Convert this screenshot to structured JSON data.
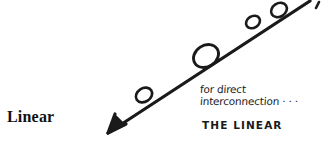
{
  "figure": {
    "background_color": "#ffffff",
    "ink_color": "#1a1a1a",
    "label": "Linear",
    "arrow": {
      "name": "diagonal-arrow",
      "direction": "down-left",
      "start": [
        310,
        1
      ],
      "end": [
        108,
        133
      ]
    },
    "nodes": [
      {
        "name": "node-1",
        "cx": 279,
        "cy": 10,
        "r": 8
      },
      {
        "name": "node-2",
        "cx": 253,
        "cy": 22,
        "r": 7
      },
      {
        "name": "node-3",
        "cx": 206,
        "cy": 56,
        "r": 12.5
      },
      {
        "name": "node-4",
        "cx": 144,
        "cy": 95,
        "r": 8
      }
    ],
    "tick_mark": {
      "name": "tick-mark",
      "x": 317,
      "y": 3
    }
  },
  "annotation": {
    "line1": "for direct",
    "line2": "interconnection · · ·",
    "caption": "THE LINEAR"
  }
}
